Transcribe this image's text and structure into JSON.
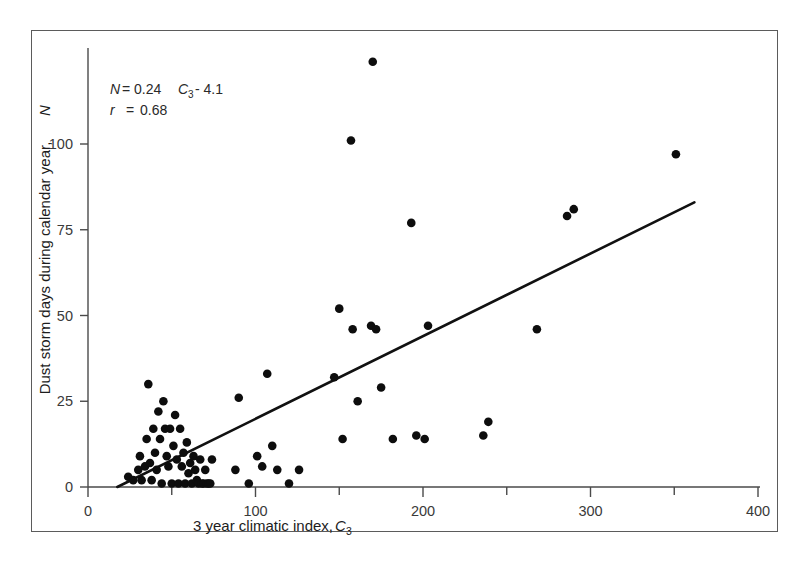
{
  "figure": {
    "background_color": "#ffffff",
    "frame_color": "#5b5b5b",
    "point_color": "#0d0d0d",
    "line_color": "#111111",
    "axis_color": "#4a4a4a"
  },
  "annotations": {
    "equation_lhs": "N",
    "equation_eq": "= 0.24",
    "equation_var": "C",
    "equation_var_sub": "3",
    "equation_rhs": "- 4.1",
    "equation_full": "N = 0.24 C3 - 4.1",
    "correlation_label": "r",
    "correlation_eq": "=",
    "correlation_value": "0.68",
    "correlation_full": "r = 0.68"
  },
  "axes": {
    "x": {
      "title_text": "3 year climatic index, ",
      "title_var": "C",
      "title_sub": "3",
      "title_full": "3 year climatic index, C3",
      "ticks": [
        0,
        100,
        200,
        300,
        400
      ],
      "tick_labels": [
        "0",
        "100",
        "200",
        "300",
        "400"
      ],
      "minor_ticks": [
        50,
        150,
        250,
        350
      ],
      "min": 0,
      "max": 400
    },
    "y": {
      "title_text": "Dust storm days during calendar year, ",
      "title_var": "N",
      "title_full": "Dust storm days during calendar year, N",
      "ticks": [
        0,
        25,
        50,
        75,
        100
      ],
      "tick_labels": [
        "0",
        "25",
        "50",
        "75",
        "100"
      ],
      "min": 0,
      "max": 110
    }
  },
  "chart_data": {
    "type": "scatter",
    "title": "",
    "subtitle": "",
    "xlabel": "3 year climatic index, C3",
    "ylabel": "Dust storm days during calendar year, N",
    "xlim": [
      0,
      400
    ],
    "ylim": [
      0,
      110
    ],
    "grid": false,
    "legend": null,
    "annotations": [
      "N = 0.24 C3 - 4.1",
      "r = 0.68"
    ],
    "fit": {
      "type": "linear",
      "slope": 0.24,
      "intercept": -4.1,
      "r": 0.68,
      "x_start": 17.5,
      "x_end": 362,
      "y_start": 0,
      "y_end": 83
    },
    "points": [
      [
        24,
        3
      ],
      [
        27,
        2
      ],
      [
        30,
        5
      ],
      [
        31,
        9
      ],
      [
        32,
        2
      ],
      [
        34,
        6
      ],
      [
        35,
        14
      ],
      [
        36,
        30
      ],
      [
        37,
        7
      ],
      [
        38,
        2
      ],
      [
        39,
        17
      ],
      [
        40,
        10
      ],
      [
        41,
        5
      ],
      [
        42,
        22
      ],
      [
        43,
        14
      ],
      [
        44,
        1
      ],
      [
        45,
        25
      ],
      [
        46,
        17
      ],
      [
        47,
        9
      ],
      [
        48,
        6
      ],
      [
        49,
        17
      ],
      [
        50,
        1
      ],
      [
        51,
        12
      ],
      [
        52,
        21
      ],
      [
        53,
        8
      ],
      [
        54,
        1
      ],
      [
        55,
        17
      ],
      [
        56,
        6
      ],
      [
        57,
        10
      ],
      [
        58,
        1
      ],
      [
        59,
        13
      ],
      [
        60,
        4
      ],
      [
        61,
        7
      ],
      [
        62,
        1
      ],
      [
        63,
        9
      ],
      [
        64,
        5
      ],
      [
        65,
        2
      ],
      [
        66,
        1
      ],
      [
        67,
        8
      ],
      [
        68,
        1
      ],
      [
        69,
        1
      ],
      [
        70,
        5
      ],
      [
        71,
        1
      ],
      [
        72,
        1
      ],
      [
        73,
        1
      ],
      [
        74,
        8
      ],
      [
        88,
        5
      ],
      [
        90,
        26
      ],
      [
        96,
        1
      ],
      [
        101,
        9
      ],
      [
        104,
        6
      ],
      [
        107,
        33
      ],
      [
        110,
        12
      ],
      [
        113,
        5
      ],
      [
        120,
        1
      ],
      [
        126,
        5
      ],
      [
        147,
        32
      ],
      [
        150,
        52
      ],
      [
        152,
        14
      ],
      [
        157,
        101
      ],
      [
        158,
        46
      ],
      [
        161,
        25
      ],
      [
        169,
        47
      ],
      [
        170,
        124
      ],
      [
        172,
        46
      ],
      [
        175,
        29
      ],
      [
        182,
        14
      ],
      [
        193,
        77
      ],
      [
        196,
        15
      ],
      [
        201,
        14
      ],
      [
        203,
        47
      ],
      [
        236,
        15
      ],
      [
        239,
        19
      ],
      [
        268,
        46
      ],
      [
        286,
        79
      ],
      [
        290,
        81
      ],
      [
        351,
        97
      ]
    ]
  }
}
